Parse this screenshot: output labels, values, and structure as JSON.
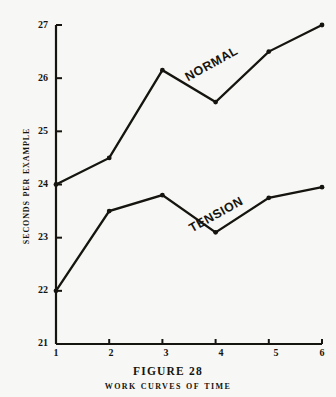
{
  "figure": {
    "caption_number": "FIGURE 28",
    "caption_title": "Work Curves of Time"
  },
  "axes": {
    "y_title": "Seconds per Example",
    "y_ticks": [
      "27",
      "26",
      "25",
      "24",
      "23",
      "22",
      "21"
    ],
    "x_ticks": [
      "1",
      "2",
      "3",
      "4",
      "5",
      "6"
    ]
  },
  "series_labels": {
    "normal": "NORMAL",
    "tension": "TENSION"
  },
  "chart_data": {
    "type": "line",
    "title": "Work Curves of Time",
    "subtitle": "FIGURE 28",
    "xlabel": "",
    "ylabel": "Seconds per Example",
    "x": [
      1,
      2,
      3,
      4,
      5,
      6
    ],
    "xlim": [
      1,
      6
    ],
    "ylim": [
      21,
      27
    ],
    "grid": false,
    "legend": "inline-on-curve",
    "series": [
      {
        "name": "NORMAL",
        "values": [
          24.0,
          24.5,
          26.15,
          25.55,
          26.5,
          27.0
        ],
        "color": "#15140f",
        "marker": "dot"
      },
      {
        "name": "TENSION",
        "values": [
          22.0,
          23.5,
          23.8,
          23.1,
          23.75,
          23.95
        ],
        "color": "#15140f",
        "marker": "dot"
      }
    ]
  },
  "colors": {
    "ink": "#15140f",
    "paper": "#f7f7f5"
  }
}
